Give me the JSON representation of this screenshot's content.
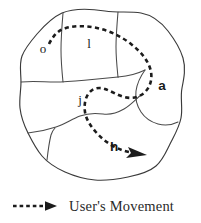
{
  "figure": {
    "background_color": "#ffffff",
    "outline_color": "#3a3a3a",
    "divider_color": "#4a4a4a",
    "path_color": "#1c1c1c"
  },
  "map": {
    "regions": [
      {
        "id": "o",
        "label": "o",
        "style": "thin",
        "x": 43,
        "y": 53
      },
      {
        "id": "l",
        "label": "l",
        "style": "thin",
        "x": 89,
        "y": 48
      },
      {
        "id": "a",
        "label": "a",
        "style": "bold",
        "x": 162,
        "y": 90
      },
      {
        "id": "j",
        "label": "j",
        "style": "thin",
        "x": 80,
        "y": 104
      },
      {
        "id": "h",
        "label": "h",
        "style": "bold",
        "x": 114,
        "y": 151
      }
    ]
  },
  "legend": {
    "symbol": "dashed-arrow-icon",
    "label": "User's Movement"
  }
}
